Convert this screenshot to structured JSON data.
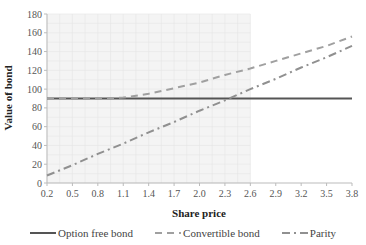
{
  "chart_data": {
    "type": "line",
    "title": "",
    "xlabel": "Share price",
    "ylabel": "Value of bond",
    "x": [
      0.2,
      0.5,
      0.8,
      1.1,
      1.4,
      1.7,
      2.0,
      2.3,
      2.6,
      2.9,
      3.2,
      3.5,
      3.8
    ],
    "x_tick_labels": [
      "0.2",
      "0.5",
      "0.8",
      "1.1",
      "1.4",
      "1.7",
      "2.0",
      "2.3",
      "2.6",
      "2.9",
      "3.2",
      "3.5",
      "3.8"
    ],
    "y_ticks": [
      0,
      20,
      40,
      60,
      80,
      100,
      120,
      140,
      160,
      180
    ],
    "ylim": [
      0,
      180
    ],
    "grid": true,
    "shaded_region_x": [
      0.2,
      2.6
    ],
    "legend_position": "bottom",
    "series": [
      {
        "name": "Option free bond",
        "style": "solid",
        "color": "#555555",
        "values": [
          90,
          90,
          90,
          90,
          90,
          90,
          90,
          90,
          90,
          90,
          90,
          90,
          90
        ]
      },
      {
        "name": "Convertible bond",
        "style": "dash",
        "color": "#a0a0a0",
        "values": [
          90,
          90,
          90,
          91,
          95,
          101,
          107,
          115,
          122,
          130,
          138,
          146,
          156
        ]
      },
      {
        "name": "Parity",
        "style": "dashdot",
        "color": "#909090",
        "values": [
          8,
          19,
          31,
          42,
          54,
          65,
          77,
          88,
          100,
          111,
          123,
          134,
          146
        ]
      }
    ]
  },
  "legend": {
    "items": [
      {
        "label": "Option free bond"
      },
      {
        "label": "Convertible bond"
      },
      {
        "label": "Parity"
      }
    ]
  }
}
